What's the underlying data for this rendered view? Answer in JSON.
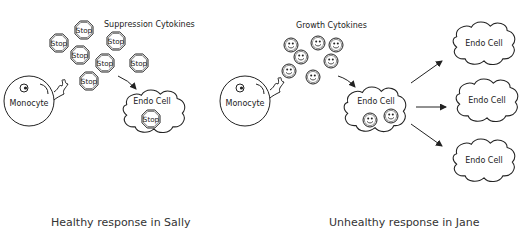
{
  "left_panel": {
    "title": "Suppression Cytokines",
    "monocyte_label": "Monocyte",
    "cytokine_label": "Stop",
    "cytokine_icon": "stop-sign-icon",
    "cytokine_count": 7,
    "endo_cell_label": "Endo Cell",
    "endo_cell_contains": "Stop",
    "caption": "Healthy response in Sally"
  },
  "right_panel": {
    "title": "Growth Cytokines",
    "monocyte_label": "Monocyte",
    "cytokine_icon": "smiley-face-icon",
    "cytokine_count": 7,
    "endo_cell_label": "Endo Cell",
    "endo_cell_contains_count": 2,
    "proliferated_cells": [
      {
        "label": "Endo Cell"
      },
      {
        "label": "Endo Cell"
      },
      {
        "label": "Endo Cell"
      }
    ],
    "caption": "Unhealthy response in Jane"
  },
  "colors": {
    "stroke": "#222222",
    "background": "#ffffff",
    "caption_text": "#333333"
  }
}
